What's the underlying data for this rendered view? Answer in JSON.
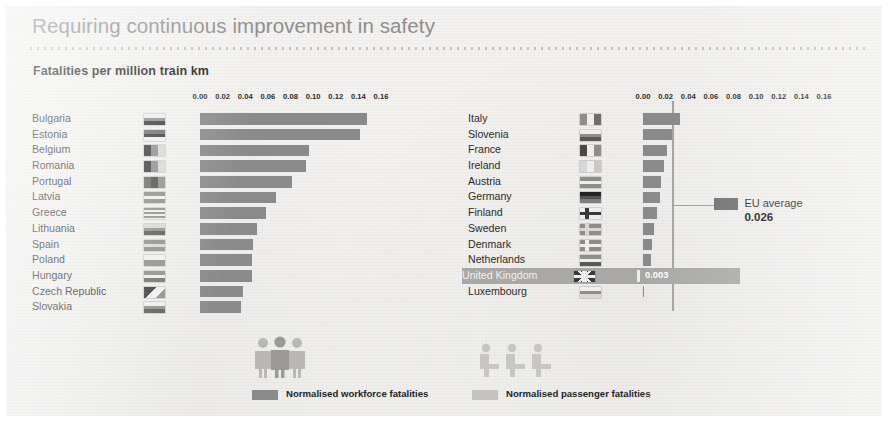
{
  "header": {
    "title": "Requiring continuous improvement in safety",
    "subtitle": "Fatalities per million train km"
  },
  "chart_data": {
    "type": "bar",
    "title": "Fatalities per million train km",
    "orientation": "horizontal",
    "xlabel": "",
    "ylabel": "",
    "xlim": [
      0,
      0.16
    ],
    "grid": false,
    "legend_position": "bottom",
    "axis_ticks": [
      "0.00",
      "0.02",
      "0.04",
      "0.06",
      "0.08",
      "0.10",
      "0.12",
      "0.14",
      "0.16"
    ],
    "axis_tick_values": [
      0.0,
      0.02,
      0.04,
      0.06,
      0.08,
      0.1,
      0.12,
      0.14,
      0.16
    ],
    "series": [
      {
        "name": "Normalised workforce fatalities",
        "color": "#8a8a8a"
      },
      {
        "name": "Normalised passenger fatalities",
        "color": "#c4c3c1"
      }
    ],
    "panels": [
      {
        "id": "left",
        "categories": [
          "Bulgaria",
          "Estonia",
          "Belgium",
          "Romania",
          "Portugal",
          "Latvia",
          "Greece",
          "Lithuania",
          "Spain",
          "Poland",
          "Hungary",
          "Czech Republic",
          "Slovakia"
        ],
        "values": [
          0.148,
          0.141,
          0.096,
          0.094,
          0.081,
          0.067,
          0.058,
          0.05,
          0.047,
          0.046,
          0.046,
          0.038,
          0.036
        ]
      },
      {
        "id": "right",
        "categories": [
          "Italy",
          "Slovenia",
          "France",
          "Ireland",
          "Austria",
          "Germany",
          "Finland",
          "Sweden",
          "Denmark",
          "Netherlands",
          "United Kingdom",
          "Luxembourg"
        ],
        "values": [
          0.033,
          0.026,
          0.021,
          0.019,
          0.016,
          0.015,
          0.012,
          0.01,
          0.008,
          0.007,
          0.003,
          0.0
        ]
      }
    ],
    "reference_line": {
      "label": "EU average",
      "value": 0.026,
      "value_text": "0.026"
    },
    "highlight": {
      "category": "United Kingdom",
      "value_text": "0.003"
    }
  },
  "axis_left": {
    "ticks": [
      "0.00",
      "0.02",
      "0.04",
      "0.06",
      "0.08",
      "0.10",
      "0.12",
      "0.14",
      "0.16"
    ]
  },
  "axis_right": {
    "ticks": [
      "0.00",
      "0.02",
      "0.04",
      "0.06",
      "0.08",
      "0.10",
      "0.12",
      "0.14",
      "0.16"
    ]
  },
  "callout": {
    "label": "EU average",
    "value": "0.026"
  },
  "highlight_row": {
    "label": "United Kingdom",
    "value": "0.003"
  },
  "legend": {
    "workforce": {
      "label": "Normalised workforce fatalities",
      "icon": "workforce-people-icon",
      "color": "#8a8a8a"
    },
    "passenger": {
      "label": "Normalised passenger fatalities",
      "icon": "seated-passengers-icon",
      "color": "#c4c3c1"
    }
  },
  "flags": {
    "Bulgaria": "flag-bulgaria-icon",
    "Estonia": "flag-estonia-icon",
    "Belgium": "flag-belgium-icon",
    "Romania": "flag-romania-icon",
    "Portugal": "flag-portugal-icon",
    "Latvia": "flag-latvia-icon",
    "Greece": "flag-greece-icon",
    "Lithuania": "flag-lithuania-icon",
    "Spain": "flag-spain-icon",
    "Poland": "flag-poland-icon",
    "Hungary": "flag-hungary-icon",
    "Czech Republic": "flag-czech-republic-icon",
    "Slovakia": "flag-slovakia-icon",
    "Italy": "flag-italy-icon",
    "Slovenia": "flag-slovenia-icon",
    "France": "flag-france-icon",
    "Ireland": "flag-ireland-icon",
    "Austria": "flag-austria-icon",
    "Germany": "flag-germany-icon",
    "Finland": "flag-finland-icon",
    "Sweden": "flag-sweden-icon",
    "Denmark": "flag-denmark-icon",
    "Netherlands": "flag-netherlands-icon",
    "United Kingdom": "flag-united-kingdom-icon",
    "Luxembourg": "flag-luxembourg-icon"
  }
}
